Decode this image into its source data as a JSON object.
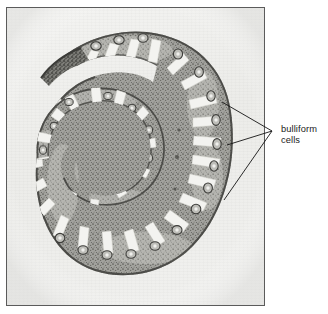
{
  "figure": {
    "type": "micrograph-with-callout",
    "panel": {
      "border_color": "#5b5b5b",
      "background_color": "#efefed"
    },
    "specimen": {
      "name": "leaf-cross-section",
      "description": "rolled monocot leaf transverse section",
      "tissue_dark": "#4a4a4a",
      "tissue_mid": "#8d8d8a",
      "tissue_light": "#c9c9c4",
      "lumen_color": "#f4f4f1"
    }
  },
  "annotation": {
    "label": {
      "line1": "bulliform",
      "line2": "cells"
    },
    "leader": {
      "color": "#141414",
      "converge_x": 272,
      "converge_y": 131,
      "targets": [
        {
          "name": "upper-bulliform-target",
          "x": 222,
          "y": 102
        },
        {
          "name": "middle-bulliform-target",
          "x": 227,
          "y": 145
        },
        {
          "name": "lower-bulliform-target",
          "x": 224,
          "y": 200
        }
      ]
    }
  }
}
